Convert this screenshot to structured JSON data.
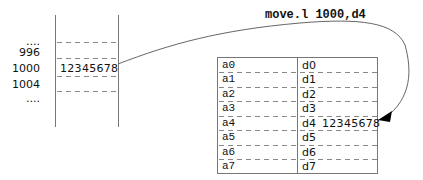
{
  "instruction": "move.l 1000,d4",
  "memory": {
    "addresses": [
      "....",
      "996",
      "1000",
      "1004",
      "...."
    ],
    "cells": [
      {
        "address": "1000",
        "value": "12345678"
      }
    ]
  },
  "registers": {
    "address": [
      "a0",
      "a1",
      "a2",
      "a3",
      "a4",
      "a5",
      "a6",
      "a7"
    ],
    "data": [
      "d0",
      "d1",
      "d2",
      "d3",
      "d4",
      "d5",
      "d6",
      "d7"
    ],
    "d4_value": "12345678"
  },
  "colors": {
    "line": "#777777",
    "dash": "#888888",
    "text": "#111111"
  }
}
